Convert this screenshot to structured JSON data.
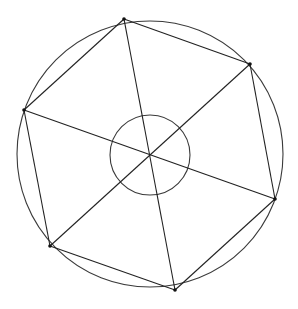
{
  "diagram": {
    "type": "geometric-construction",
    "stroke_color": "#333333",
    "background_color": "#ffffff",
    "outer_circle": {
      "cx": 150,
      "cy": 154,
      "r": 133
    },
    "inner_circle": {
      "cx": 150,
      "cy": 155,
      "r": 40
    },
    "vertices": [
      {
        "id": "A",
        "x": 124,
        "y": 19
      },
      {
        "id": "B",
        "x": 250,
        "y": 64
      },
      {
        "id": "C",
        "x": 275,
        "y": 199
      },
      {
        "id": "D",
        "x": 175,
        "y": 290
      },
      {
        "id": "E",
        "x": 50,
        "y": 246
      },
      {
        "id": "F",
        "x": 24,
        "y": 110
      }
    ],
    "hexagon_edges": [
      [
        "A",
        "B"
      ],
      [
        "B",
        "C"
      ],
      [
        "C",
        "D"
      ],
      [
        "D",
        "E"
      ],
      [
        "E",
        "F"
      ],
      [
        "F",
        "A"
      ]
    ],
    "diameters": [
      [
        "A",
        "D"
      ],
      [
        "B",
        "E"
      ],
      [
        "F",
        "C"
      ]
    ]
  }
}
